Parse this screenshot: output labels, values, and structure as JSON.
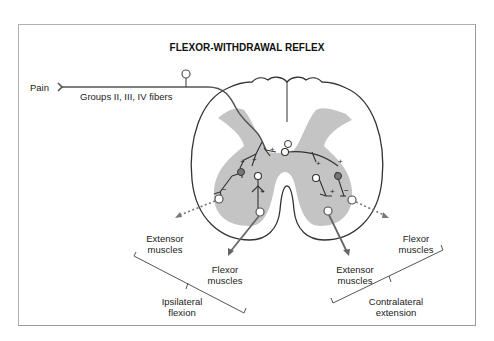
{
  "title": "FLEXOR-WITHDRAWAL REFLEX",
  "afferent": {
    "stimulus": "Pain",
    "fibers": "Groups II, III, IV fibers"
  },
  "outputs": {
    "ipsilateral": {
      "extensor": "Extensor muscles",
      "flexor": "Flexor muscles",
      "group": "Ipsilateral flexion"
    },
    "contralateral": {
      "extensor": "Extensor muscles",
      "flexor": "Flexor muscles",
      "group": "Contralateral extension"
    }
  },
  "synapse_signs": {
    "excitatory": "+",
    "inhibitory": "−"
  },
  "colors": {
    "gray_matter": "#c4c4c4",
    "line": "#333333",
    "arrow": "#666666",
    "inhibitory_neuron": "#777777"
  }
}
